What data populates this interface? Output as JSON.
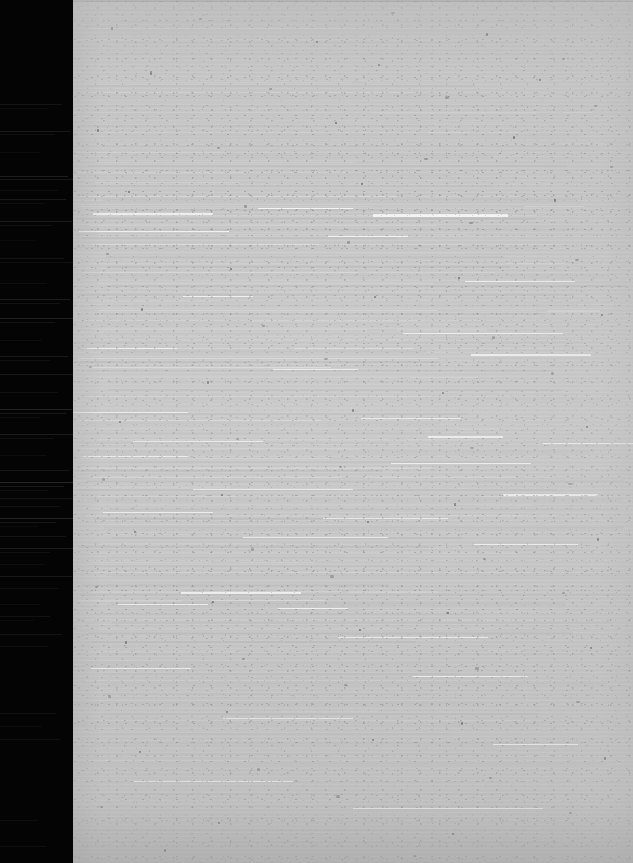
{
  "document": {
    "kind": "scanned-page",
    "condition": "severely-degraded",
    "legible_text": "",
    "caption": "",
    "notes_visible_on_screen": ""
  },
  "canvas": {
    "width": 633,
    "height": 863
  },
  "regions": {
    "left_margin": {
      "name": "film-border",
      "x": 0,
      "y": 0,
      "width": 73,
      "height": 863,
      "color": "#040404",
      "label": ""
    },
    "page_sheet": {
      "name": "paper-page",
      "x": 73,
      "y": 0,
      "width": 560,
      "height": 863,
      "color": "#c4c4c4",
      "label": ""
    }
  },
  "colors": {
    "margin_black": "#040404",
    "margin_streak": "#6a6a6a",
    "paper_gray": "#c4c4c4",
    "paper_shadow": "#a8a8a8",
    "paper_highlight": "#e8e8e8",
    "speck_dark": "#4a4a4a",
    "page_edge": "#9a9a9a"
  },
  "margin_streaks": [
    {
      "y": 104,
      "w": 62,
      "o": 0.16
    },
    {
      "y": 108,
      "w": 48,
      "o": 0.1
    },
    {
      "y": 131,
      "w": 70,
      "o": 0.22
    },
    {
      "y": 134,
      "w": 55,
      "o": 0.12
    },
    {
      "y": 152,
      "w": 40,
      "o": 0.09
    },
    {
      "y": 176,
      "w": 68,
      "o": 0.26
    },
    {
      "y": 179,
      "w": 73,
      "o": 0.18
    },
    {
      "y": 190,
      "w": 58,
      "o": 0.11
    },
    {
      "y": 199,
      "w": 66,
      "o": 0.2
    },
    {
      "y": 203,
      "w": 44,
      "o": 0.1
    },
    {
      "y": 221,
      "w": 72,
      "o": 0.24
    },
    {
      "y": 225,
      "w": 52,
      "o": 0.13
    },
    {
      "y": 240,
      "w": 36,
      "o": 0.08
    },
    {
      "y": 258,
      "w": 64,
      "o": 0.17
    },
    {
      "y": 262,
      "w": 73,
      "o": 0.12
    },
    {
      "y": 283,
      "w": 47,
      "o": 0.1
    },
    {
      "y": 299,
      "w": 70,
      "o": 0.23
    },
    {
      "y": 303,
      "w": 60,
      "o": 0.14
    },
    {
      "y": 318,
      "w": 73,
      "o": 0.28
    },
    {
      "y": 322,
      "w": 55,
      "o": 0.15
    },
    {
      "y": 340,
      "w": 42,
      "o": 0.09
    },
    {
      "y": 356,
      "w": 68,
      "o": 0.21
    },
    {
      "y": 360,
      "w": 50,
      "o": 0.12
    },
    {
      "y": 374,
      "w": 73,
      "o": 0.19
    },
    {
      "y": 392,
      "w": 58,
      "o": 0.13
    },
    {
      "y": 409,
      "w": 72,
      "o": 0.3
    },
    {
      "y": 413,
      "w": 66,
      "o": 0.2
    },
    {
      "y": 417,
      "w": 40,
      "o": 0.11
    },
    {
      "y": 434,
      "w": 73,
      "o": 0.24
    },
    {
      "y": 438,
      "w": 54,
      "o": 0.13
    },
    {
      "y": 455,
      "w": 46,
      "o": 0.1
    },
    {
      "y": 470,
      "w": 70,
      "o": 0.18
    },
    {
      "y": 482,
      "w": 73,
      "o": 0.34
    },
    {
      "y": 486,
      "w": 64,
      "o": 0.22
    },
    {
      "y": 490,
      "w": 48,
      "o": 0.12
    },
    {
      "y": 498,
      "w": 73,
      "o": 0.17
    },
    {
      "y": 506,
      "w": 60,
      "o": 0.14
    },
    {
      "y": 518,
      "w": 73,
      "o": 0.3
    },
    {
      "y": 522,
      "w": 56,
      "o": 0.18
    },
    {
      "y": 526,
      "w": 38,
      "o": 0.09
    },
    {
      "y": 536,
      "w": 66,
      "o": 0.16
    },
    {
      "y": 548,
      "w": 73,
      "o": 0.26
    },
    {
      "y": 552,
      "w": 50,
      "o": 0.13
    },
    {
      "y": 564,
      "w": 44,
      "o": 0.1
    },
    {
      "y": 576,
      "w": 72,
      "o": 0.2
    },
    {
      "y": 588,
      "w": 58,
      "o": 0.12
    },
    {
      "y": 604,
      "w": 40,
      "o": 0.09
    },
    {
      "y": 616,
      "w": 50,
      "o": 0.14
    },
    {
      "y": 620,
      "w": 34,
      "o": 0.08
    },
    {
      "y": 634,
      "w": 62,
      "o": 0.16
    },
    {
      "y": 646,
      "w": 48,
      "o": 0.1
    },
    {
      "y": 713,
      "w": 56,
      "o": 0.13
    },
    {
      "y": 726,
      "w": 42,
      "o": 0.09
    },
    {
      "y": 739,
      "w": 60,
      "o": 0.12
    },
    {
      "y": 820,
      "w": 38,
      "o": 0.1
    },
    {
      "y": 846,
      "w": 46,
      "o": 0.11
    }
  ],
  "ghost_text_bands": [
    {
      "name": "header-block",
      "top": 6,
      "height": 60,
      "lines": 5,
      "spacing": 11,
      "density": "sparse"
    },
    {
      "name": "body-block-1",
      "top": 82,
      "height": 110,
      "lines": 11,
      "spacing": 10,
      "density": "light"
    },
    {
      "name": "body-block-2",
      "top": 196,
      "height": 210,
      "lines": 22,
      "spacing": 9.5,
      "density": "dense"
    },
    {
      "name": "body-block-3",
      "top": 410,
      "height": 235,
      "lines": 25,
      "spacing": 9.5,
      "density": "dense"
    },
    {
      "name": "body-block-4",
      "top": 650,
      "height": 120,
      "lines": 12,
      "spacing": 10,
      "density": "light"
    },
    {
      "name": "footer-block",
      "top": 778,
      "height": 70,
      "lines": 6,
      "spacing": 12,
      "density": "sparse"
    }
  ],
  "hot_streaks": [
    {
      "x": 20,
      "y": 213,
      "w": 120,
      "h": 2
    },
    {
      "x": 185,
      "y": 208,
      "w": 95,
      "h": 1
    },
    {
      "x": 300,
      "y": 214,
      "w": 135,
      "h": 3
    },
    {
      "x": 6,
      "y": 231,
      "w": 150,
      "h": 1
    },
    {
      "x": 255,
      "y": 236,
      "w": 80,
      "h": 1
    },
    {
      "x": 392,
      "y": 281,
      "w": 110,
      "h": 1
    },
    {
      "x": 110,
      "y": 296,
      "w": 70,
      "h": 1
    },
    {
      "x": 330,
      "y": 333,
      "w": 160,
      "h": 1
    },
    {
      "x": 14,
      "y": 348,
      "w": 90,
      "h": 1
    },
    {
      "x": 398,
      "y": 354,
      "w": 120,
      "h": 2
    },
    {
      "x": 200,
      "y": 369,
      "w": 85,
      "h": 1
    },
    {
      "x": 0,
      "y": 412,
      "w": 115,
      "h": 1
    },
    {
      "x": 288,
      "y": 418,
      "w": 100,
      "h": 1
    },
    {
      "x": 355,
      "y": 436,
      "w": 75,
      "h": 2
    },
    {
      "x": 60,
      "y": 441,
      "w": 130,
      "h": 1
    },
    {
      "x": 470,
      "y": 443,
      "w": 90,
      "h": 1
    },
    {
      "x": 10,
      "y": 456,
      "w": 105,
      "h": 1
    },
    {
      "x": 318,
      "y": 463,
      "w": 140,
      "h": 1
    },
    {
      "x": 120,
      "y": 489,
      "w": 160,
      "h": 1
    },
    {
      "x": 430,
      "y": 494,
      "w": 95,
      "h": 2
    },
    {
      "x": 30,
      "y": 512,
      "w": 110,
      "h": 1
    },
    {
      "x": 250,
      "y": 518,
      "w": 125,
      "h": 1
    },
    {
      "x": 170,
      "y": 537,
      "w": 145,
      "h": 1
    },
    {
      "x": 400,
      "y": 544,
      "w": 105,
      "h": 1
    },
    {
      "x": 108,
      "y": 592,
      "w": 120,
      "h": 2
    },
    {
      "x": 45,
      "y": 604,
      "w": 90,
      "h": 1
    },
    {
      "x": 205,
      "y": 608,
      "w": 70,
      "h": 1
    },
    {
      "x": 265,
      "y": 637,
      "w": 150,
      "h": 1
    },
    {
      "x": 18,
      "y": 668,
      "w": 100,
      "h": 1
    },
    {
      "x": 340,
      "y": 676,
      "w": 115,
      "h": 1
    },
    {
      "x": 150,
      "y": 718,
      "w": 130,
      "h": 1
    },
    {
      "x": 420,
      "y": 744,
      "w": 85,
      "h": 1
    },
    {
      "x": 60,
      "y": 781,
      "w": 160,
      "h": 1
    },
    {
      "x": 280,
      "y": 808,
      "w": 190,
      "h": 1
    }
  ],
  "flecks": [
    {
      "x": 38,
      "y": 27,
      "w": 2,
      "h": 3,
      "dark": true
    },
    {
      "x": 126,
      "y": 18,
      "w": 3,
      "h": 2,
      "dark": false
    },
    {
      "x": 243,
      "y": 41,
      "w": 2,
      "h": 2,
      "dark": true
    },
    {
      "x": 318,
      "y": 12,
      "w": 4,
      "h": 2,
      "dark": false
    },
    {
      "x": 413,
      "y": 33,
      "w": 2,
      "h": 3,
      "dark": true
    },
    {
      "x": 489,
      "y": 58,
      "w": 3,
      "h": 2,
      "dark": false
    },
    {
      "x": 77,
      "y": 71,
      "w": 2,
      "h": 4,
      "dark": true
    },
    {
      "x": 196,
      "y": 88,
      "w": 3,
      "h": 2,
      "dark": false
    },
    {
      "x": 305,
      "y": 64,
      "w": 2,
      "h": 2,
      "dark": true
    },
    {
      "x": 372,
      "y": 96,
      "w": 4,
      "h": 3,
      "dark": false
    },
    {
      "x": 466,
      "y": 79,
      "w": 2,
      "h": 2,
      "dark": true
    },
    {
      "x": 521,
      "y": 105,
      "w": 3,
      "h": 2,
      "dark": false
    },
    {
      "x": 24,
      "y": 129,
      "w": 2,
      "h": 3,
      "dark": true
    },
    {
      "x": 144,
      "y": 147,
      "w": 3,
      "h": 2,
      "dark": false
    },
    {
      "x": 262,
      "y": 122,
      "w": 2,
      "h": 2,
      "dark": true
    },
    {
      "x": 351,
      "y": 158,
      "w": 4,
      "h": 2,
      "dark": false
    },
    {
      "x": 440,
      "y": 136,
      "w": 2,
      "h": 3,
      "dark": true
    },
    {
      "x": 537,
      "y": 166,
      "w": 3,
      "h": 2,
      "dark": false
    },
    {
      "x": 55,
      "y": 191,
      "w": 2,
      "h": 2,
      "dark": true
    },
    {
      "x": 171,
      "y": 205,
      "w": 3,
      "h": 3,
      "dark": false
    },
    {
      "x": 288,
      "y": 183,
      "w": 2,
      "h": 2,
      "dark": true
    },
    {
      "x": 396,
      "y": 222,
      "w": 4,
      "h": 2,
      "dark": false
    },
    {
      "x": 481,
      "y": 199,
      "w": 2,
      "h": 3,
      "dark": true
    },
    {
      "x": 33,
      "y": 253,
      "w": 3,
      "h": 2,
      "dark": false
    },
    {
      "x": 157,
      "y": 268,
      "w": 2,
      "h": 2,
      "dark": true
    },
    {
      "x": 274,
      "y": 241,
      "w": 3,
      "h": 3,
      "dark": false
    },
    {
      "x": 385,
      "y": 277,
      "w": 2,
      "h": 2,
      "dark": true
    },
    {
      "x": 502,
      "y": 259,
      "w": 4,
      "h": 2,
      "dark": false
    },
    {
      "x": 68,
      "y": 308,
      "w": 2,
      "h": 3,
      "dark": true
    },
    {
      "x": 189,
      "y": 325,
      "w": 3,
      "h": 2,
      "dark": false
    },
    {
      "x": 301,
      "y": 296,
      "w": 2,
      "h": 2,
      "dark": true
    },
    {
      "x": 419,
      "y": 336,
      "w": 3,
      "h": 3,
      "dark": false
    },
    {
      "x": 528,
      "y": 314,
      "w": 2,
      "h": 2,
      "dark": true
    },
    {
      "x": 16,
      "y": 366,
      "w": 3,
      "h": 2,
      "dark": false
    },
    {
      "x": 134,
      "y": 381,
      "w": 2,
      "h": 3,
      "dark": true
    },
    {
      "x": 251,
      "y": 358,
      "w": 4,
      "h": 2,
      "dark": false
    },
    {
      "x": 369,
      "y": 392,
      "w": 2,
      "h": 2,
      "dark": true
    },
    {
      "x": 478,
      "y": 372,
      "w": 3,
      "h": 3,
      "dark": false
    },
    {
      "x": 46,
      "y": 421,
      "w": 2,
      "h": 2,
      "dark": true
    },
    {
      "x": 163,
      "y": 438,
      "w": 3,
      "h": 2,
      "dark": false
    },
    {
      "x": 279,
      "y": 409,
      "w": 2,
      "h": 3,
      "dark": true
    },
    {
      "x": 397,
      "y": 447,
      "w": 4,
      "h": 2,
      "dark": false
    },
    {
      "x": 513,
      "y": 426,
      "w": 2,
      "h": 2,
      "dark": true
    },
    {
      "x": 29,
      "y": 478,
      "w": 3,
      "h": 3,
      "dark": false
    },
    {
      "x": 148,
      "y": 494,
      "w": 2,
      "h": 2,
      "dark": true
    },
    {
      "x": 266,
      "y": 466,
      "w": 3,
      "h": 2,
      "dark": false
    },
    {
      "x": 381,
      "y": 503,
      "w": 2,
      "h": 3,
      "dark": true
    },
    {
      "x": 495,
      "y": 483,
      "w": 4,
      "h": 2,
      "dark": false
    },
    {
      "x": 61,
      "y": 531,
      "w": 2,
      "h": 2,
      "dark": true
    },
    {
      "x": 178,
      "y": 548,
      "w": 3,
      "h": 3,
      "dark": false
    },
    {
      "x": 294,
      "y": 521,
      "w": 2,
      "h": 2,
      "dark": true
    },
    {
      "x": 410,
      "y": 558,
      "w": 3,
      "h": 2,
      "dark": false
    },
    {
      "x": 524,
      "y": 538,
      "w": 2,
      "h": 3,
      "dark": true
    },
    {
      "x": 22,
      "y": 586,
      "w": 3,
      "h": 2,
      "dark": false
    },
    {
      "x": 139,
      "y": 601,
      "w": 2,
      "h": 2,
      "dark": true
    },
    {
      "x": 257,
      "y": 575,
      "w": 4,
      "h": 3,
      "dark": false
    },
    {
      "x": 374,
      "y": 612,
      "w": 2,
      "h": 2,
      "dark": true
    },
    {
      "x": 489,
      "y": 592,
      "w": 3,
      "h": 2,
      "dark": false
    },
    {
      "x": 52,
      "y": 641,
      "w": 2,
      "h": 3,
      "dark": true
    },
    {
      "x": 169,
      "y": 658,
      "w": 3,
      "h": 2,
      "dark": false
    },
    {
      "x": 286,
      "y": 629,
      "w": 2,
      "h": 2,
      "dark": true
    },
    {
      "x": 402,
      "y": 667,
      "w": 4,
      "h": 3,
      "dark": false
    },
    {
      "x": 517,
      "y": 647,
      "w": 2,
      "h": 2,
      "dark": true
    },
    {
      "x": 35,
      "y": 695,
      "w": 3,
      "h": 3,
      "dark": false
    },
    {
      "x": 153,
      "y": 711,
      "w": 2,
      "h": 2,
      "dark": true
    },
    {
      "x": 271,
      "y": 684,
      "w": 3,
      "h": 2,
      "dark": false
    },
    {
      "x": 388,
      "y": 722,
      "w": 2,
      "h": 3,
      "dark": true
    },
    {
      "x": 503,
      "y": 701,
      "w": 4,
      "h": 2,
      "dark": false
    },
    {
      "x": 66,
      "y": 751,
      "w": 2,
      "h": 2,
      "dark": true
    },
    {
      "x": 184,
      "y": 768,
      "w": 3,
      "h": 3,
      "dark": false
    },
    {
      "x": 299,
      "y": 739,
      "w": 2,
      "h": 2,
      "dark": true
    },
    {
      "x": 416,
      "y": 777,
      "w": 3,
      "h": 2,
      "dark": false
    },
    {
      "x": 531,
      "y": 757,
      "w": 2,
      "h": 3,
      "dark": true
    },
    {
      "x": 27,
      "y": 806,
      "w": 3,
      "h": 2,
      "dark": false
    },
    {
      "x": 145,
      "y": 822,
      "w": 2,
      "h": 2,
      "dark": true
    },
    {
      "x": 263,
      "y": 795,
      "w": 4,
      "h": 3,
      "dark": false
    },
    {
      "x": 379,
      "y": 833,
      "w": 2,
      "h": 2,
      "dark": true
    },
    {
      "x": 496,
      "y": 812,
      "w": 3,
      "h": 2,
      "dark": false
    },
    {
      "x": 91,
      "y": 849,
      "w": 2,
      "h": 3,
      "dark": true
    },
    {
      "x": 340,
      "y": 855,
      "w": 3,
      "h": 2,
      "dark": false
    }
  ]
}
